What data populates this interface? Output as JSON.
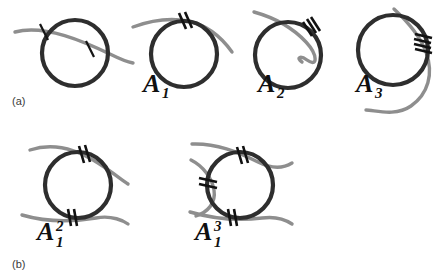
{
  "figure": {
    "background_color": "#ffffff",
    "loop_color": "#2e2e2e",
    "strand_color": "#8e8e8e",
    "tick_color": "#121212",
    "label_color": "#3a3a3a"
  },
  "panels": [
    {
      "id": "a",
      "label": "(a)",
      "items": [
        {
          "name": "transverse-crossing",
          "symbol": null,
          "symbol_base": "",
          "symbol_sub": "",
          "symbol_sup": "",
          "tick_count": 2,
          "tick_groups": 2,
          "strands": 1,
          "description": "circle crossed transversally by one strand, single tick at each of two crossings"
        },
        {
          "name": "tangency-A1",
          "symbol": "A1",
          "symbol_base": "A",
          "symbol_sub": "1",
          "symbol_sup": "",
          "tick_count": 2,
          "tick_groups": 1,
          "strands": 1,
          "description": "circle with one strand tangent at top, double tick"
        },
        {
          "name": "tangency-A2",
          "symbol": "A2",
          "symbol_base": "A",
          "symbol_sub": "2",
          "symbol_sup": "",
          "tick_count": 3,
          "tick_groups": 1,
          "strands": 1,
          "description": "circle with strand of higher order contact at upper right, triple tick"
        },
        {
          "name": "tangency-A3",
          "symbol": "A3",
          "symbol_base": "A",
          "symbol_sub": "3",
          "symbol_sup": "",
          "tick_count": 4,
          "tick_groups": 1,
          "strands": 1,
          "description": "circle with strand of highest order contact at right, quadruple tick"
        }
      ]
    },
    {
      "id": "b",
      "label": "(b)",
      "items": [
        {
          "name": "tangency-A1-squared",
          "symbol": "A1^2",
          "symbol_base": "A",
          "symbol_sub": "1",
          "symbol_sup": "2",
          "tick_count": 4,
          "tick_groups": 2,
          "strands": 2,
          "description": "circle with two strands tangent at top and bottom, double tick at each"
        },
        {
          "name": "tangency-A1-cubed",
          "symbol": "A1^3",
          "symbol_base": "A",
          "symbol_sub": "1",
          "symbol_sup": "3",
          "tick_count": 6,
          "tick_groups": 3,
          "strands": 3,
          "description": "circle with three strands tangent at top, left and bottom, double tick at each"
        }
      ]
    }
  ]
}
